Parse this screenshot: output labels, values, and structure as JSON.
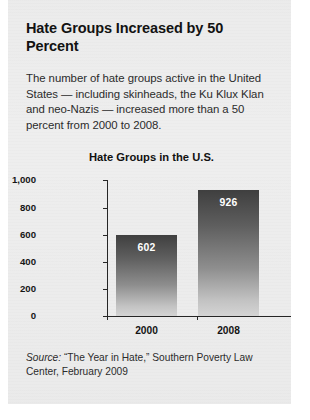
{
  "headline": "Hate Groups Increased by 50 Percent",
  "lede": "The number of hate groups active in the United States — including skinheads, the Ku Klux Klan and neo-Nazis — increased more than a 50 percent from 2000 to 2008.",
  "source": {
    "lead": "Source:",
    "text": " “The Year in Hate,” Southern Poverty Law Center, February 2009"
  },
  "chart_data": {
    "type": "bar",
    "title": "Hate Groups in the U.S.",
    "categories": [
      "2000",
      "2008"
    ],
    "values": [
      602,
      926
    ],
    "value_labels": [
      "602",
      "926"
    ],
    "xlabel": "",
    "ylabel": "",
    "ylim": [
      0,
      1000
    ],
    "yticks": [
      0,
      200,
      400,
      600,
      800,
      1000
    ],
    "ytick_labels": [
      "0",
      "200",
      "400",
      "600",
      "800",
      "1,000"
    ],
    "grid": false,
    "legend": false,
    "bar_fill_top": "#3f3f3f",
    "bar_fill_bottom": "#d4d4d4",
    "axis_color": "#262626"
  },
  "colors": {
    "panel_background": "#eeeeee",
    "page_background": "#ffffff",
    "text": "#2b2b2b",
    "heading": "#121212"
  }
}
